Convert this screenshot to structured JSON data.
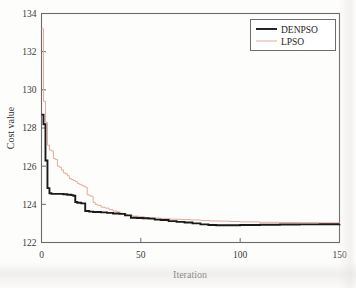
{
  "chart_data": {
    "type": "line",
    "title": "",
    "xlabel": "Iteration",
    "ylabel": "Cost value",
    "xlim": [
      0,
      150
    ],
    "ylim": [
      122,
      134
    ],
    "xticks": [
      0,
      50,
      100,
      150
    ],
    "yticks": [
      122,
      124,
      126,
      128,
      130,
      132,
      134
    ],
    "xtick_labels": [
      "0",
      "50",
      "100",
      "150"
    ],
    "ytick_labels": [
      "122",
      "124",
      "126",
      "128",
      "130",
      "132",
      "134"
    ],
    "grid": false,
    "legend_position": "top-right",
    "series": [
      {
        "name": "DENPSO",
        "color": "#1a1a1a",
        "x": [
          0,
          1,
          2,
          3,
          4,
          5,
          7,
          9,
          11,
          13,
          15,
          16,
          17,
          18,
          20,
          22,
          24,
          26,
          28,
          30,
          33,
          36,
          39,
          42,
          45,
          48,
          51,
          54,
          57,
          60,
          64,
          68,
          72,
          76,
          80,
          84,
          88,
          92,
          100,
          110,
          120,
          130,
          140,
          150
        ],
        "y": [
          128.7,
          128.2,
          126.3,
          124.85,
          124.58,
          124.55,
          124.55,
          124.55,
          124.53,
          124.5,
          124.48,
          124.45,
          124.12,
          124.08,
          124.05,
          123.65,
          123.62,
          123.6,
          123.6,
          123.58,
          123.55,
          123.52,
          123.5,
          123.42,
          123.3,
          123.28,
          123.27,
          123.25,
          123.2,
          123.18,
          123.12,
          123.08,
          123.05,
          123.0,
          122.95,
          122.92,
          122.9,
          122.9,
          122.92,
          122.93,
          122.94,
          122.95,
          122.96,
          122.97
        ]
      },
      {
        "name": "LPSO",
        "color": "#e8a79c",
        "x": [
          0,
          1,
          2,
          3,
          4,
          5,
          6,
          7,
          8,
          9,
          10,
          11,
          12,
          13,
          14,
          15,
          16,
          17,
          18,
          19,
          20,
          21,
          22,
          23,
          24,
          25,
          26,
          27,
          28,
          30,
          32,
          34,
          36,
          38,
          40,
          43,
          46,
          49,
          52,
          56,
          60,
          65,
          70,
          75,
          80,
          85,
          90,
          95,
          100,
          110,
          120,
          130,
          140,
          150
        ],
        "y": [
          133.2,
          129.4,
          128.3,
          127.1,
          126.85,
          126.8,
          126.4,
          126.35,
          126.0,
          125.95,
          125.8,
          125.65,
          125.6,
          125.5,
          125.35,
          125.3,
          125.25,
          125.2,
          125.1,
          125.05,
          125.0,
          124.95,
          124.9,
          124.5,
          124.45,
          124.42,
          124.1,
          124.0,
          123.95,
          123.85,
          123.8,
          123.72,
          123.65,
          123.6,
          123.5,
          123.42,
          123.38,
          123.35,
          123.3,
          123.28,
          123.25,
          123.22,
          123.2,
          123.18,
          123.15,
          123.13,
          123.12,
          123.1,
          123.08,
          123.06,
          123.05,
          123.04,
          123.03,
          123.02
        ]
      }
    ]
  },
  "legend": {
    "entries": [
      {
        "label": "DENPSO"
      },
      {
        "label": "LPSO"
      }
    ]
  }
}
